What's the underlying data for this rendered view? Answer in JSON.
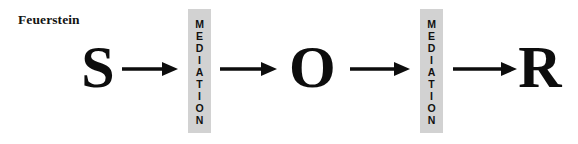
{
  "figure": {
    "type": "process-diagram",
    "caption": "Feuerstein",
    "background_color": "#ffffff",
    "ink_color": "#0d0d0d",
    "bar_fill_color": "#d2d2d2"
  },
  "nodes": [
    {
      "id": "stimulus",
      "label": "S"
    },
    {
      "id": "organism",
      "label": "O"
    },
    {
      "id": "response",
      "label": "R"
    }
  ],
  "mediation_bars": [
    {
      "id": "mediation-left",
      "label": "MEDIATION",
      "letters": "M\nE\nD\nI\nA\nT\nI\nO\nN"
    },
    {
      "id": "mediation-right",
      "label": "MEDIATION",
      "letters": "M\nE\nD\nI\nA\nT\nI\nO\nN"
    }
  ],
  "arrows": [
    {
      "id": "arrow-s-to-mediation1",
      "from": "S",
      "to": "MEDIATION",
      "direction": "right",
      "glyph": "arrow-right"
    },
    {
      "id": "arrow-mediation1-to-o",
      "from": "MEDIATION",
      "to": "O",
      "direction": "right",
      "glyph": "arrow-right"
    },
    {
      "id": "arrow-o-to-mediation2",
      "from": "O",
      "to": "MEDIATION",
      "direction": "right",
      "glyph": "arrow-right"
    },
    {
      "id": "arrow-mediation2-to-r",
      "from": "MEDIATION",
      "to": "R",
      "direction": "right",
      "glyph": "arrow-right"
    }
  ],
  "sequence_text": "S → MEDIATION → O → MEDIATION → R"
}
